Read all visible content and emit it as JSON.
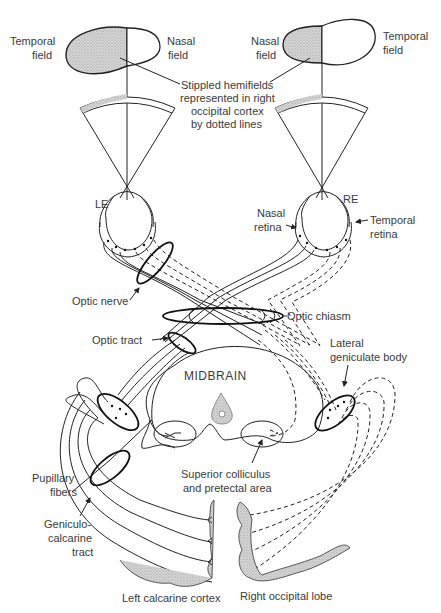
{
  "diagram": {
    "labels": {
      "left_temporal_field": [
        "Temporal",
        "field"
      ],
      "left_nasal_field": [
        "Nasal",
        "field"
      ],
      "right_nasal_field": [
        "Nasal",
        "field"
      ],
      "right_temporal_field": [
        "Temporal",
        "field"
      ],
      "stippled_note": [
        "Stippled hemifields",
        "represented in right",
        "occipital cortex",
        "by dotted lines"
      ],
      "left_eye": "LE",
      "right_eye": "RE",
      "nasal_retina": [
        "Nasal",
        "retina"
      ],
      "temporal_retina": [
        "Temporal",
        "retina"
      ],
      "optic_nerve": "Optic nerve",
      "optic_chiasm": "Optic chiasm",
      "optic_tract": "Optic tract",
      "midbrain": "MIDBRAIN",
      "lateral_geniculate_body": [
        "Lateral",
        "geniculate body"
      ],
      "superior_colliculus": [
        "Superior colliculus",
        "and pretectal area"
      ],
      "pupillary_fibers": [
        "Pupillary",
        "fibers"
      ],
      "geniculocalcarine_tract": [
        "Geniculo-",
        "calcarine",
        "tract"
      ],
      "left_calcarine_cortex": "Left calcarine cortex",
      "right_occipital_lobe": "Right occipital lobe"
    },
    "legend": {
      "solid_lines": "fibers from left hemiretinas",
      "dotted_lines": "fibers representing stippled hemifields (right occipital cortex)"
    },
    "colors": {
      "line": "#222222",
      "text": "#3a3a3a",
      "stipple": "#c8c8c8",
      "background": "#ffffff"
    }
  }
}
